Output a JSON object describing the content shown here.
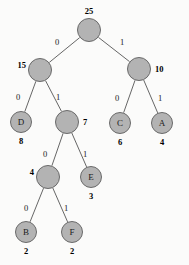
{
  "figure": {
    "background_color": "#fbfbfa",
    "node_fill": "#b3b3b3",
    "node_stroke": "#6a6a6a",
    "edge_stroke": "#555555"
  },
  "chart_data": {
    "type": "diagram",
    "diagram_kind": "binary-tree",
    "title": "",
    "nodes": [
      {
        "id": "n25",
        "label": "",
        "weight": "25",
        "weight_pos": "top",
        "x": 89,
        "y": 30,
        "r": 12
      },
      {
        "id": "n15",
        "label": "",
        "weight": "15",
        "weight_pos": "left",
        "x": 40,
        "y": 70,
        "r": 12
      },
      {
        "id": "n10",
        "label": "",
        "weight": "10",
        "weight_pos": "right",
        "x": 139,
        "y": 69,
        "r": 12
      },
      {
        "id": "nD",
        "label": "D",
        "weight": "8",
        "weight_pos": "bottom",
        "x": 21,
        "y": 122,
        "r": 11
      },
      {
        "id": "n7",
        "label": "",
        "weight": "7",
        "weight_pos": "right",
        "x": 67,
        "y": 122,
        "r": 12
      },
      {
        "id": "nC",
        "label": "C",
        "weight": "6",
        "weight_pos": "bottom",
        "x": 120,
        "y": 123,
        "r": 11
      },
      {
        "id": "nA",
        "label": "A",
        "weight": "4",
        "weight_pos": "bottom",
        "x": 162,
        "y": 123,
        "r": 11
      },
      {
        "id": "n4",
        "label": "",
        "weight": "4",
        "weight_pos": "left",
        "x": 48,
        "y": 177,
        "r": 12
      },
      {
        "id": "nE",
        "label": "E",
        "weight": "3",
        "weight_pos": "bottom",
        "x": 91,
        "y": 177,
        "r": 11
      },
      {
        "id": "nB",
        "label": "B",
        "weight": "2",
        "weight_pos": "bottom",
        "x": 26,
        "y": 232,
        "r": 11
      },
      {
        "id": "nF",
        "label": "F",
        "weight": "2",
        "weight_pos": "bottom",
        "x": 72,
        "y": 232,
        "r": 11
      }
    ],
    "edges": [
      {
        "from": "n25",
        "to": "n15",
        "bit": "0",
        "lx": 55,
        "ly": 38
      },
      {
        "from": "n25",
        "to": "n10",
        "bit": "1",
        "lx": 120,
        "ly": 38
      },
      {
        "from": "n15",
        "to": "nD",
        "bit": "0",
        "lx": 16,
        "ly": 93
      },
      {
        "from": "n15",
        "to": "n7",
        "bit": "1",
        "lx": 56,
        "ly": 93
      },
      {
        "from": "n10",
        "to": "nC",
        "bit": "0",
        "lx": 115,
        "ly": 94
      },
      {
        "from": "n10",
        "to": "nA",
        "bit": "1",
        "lx": 158,
        "ly": 94
      },
      {
        "from": "n7",
        "to": "n4",
        "bit": "0",
        "lx": 43,
        "ly": 150
      },
      {
        "from": "n7",
        "to": "nE",
        "bit": "1",
        "lx": 83,
        "ly": 150
      },
      {
        "from": "n4",
        "to": "nB",
        "bit": "0",
        "lx": 24,
        "ly": 204
      },
      {
        "from": "n4",
        "to": "nF",
        "bit": "1",
        "lx": 64,
        "ly": 204
      }
    ]
  }
}
